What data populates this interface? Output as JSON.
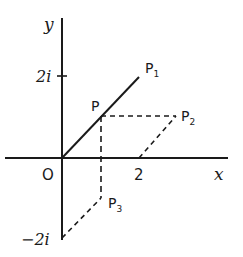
{
  "diagram": {
    "title": "",
    "axes": {
      "x_label": "x",
      "y_label": "y",
      "origin_label": "O",
      "x_tick_label": "2",
      "y_tick_pos_label": "2i",
      "y_tick_neg_label": "−2i"
    },
    "points": {
      "P": {
        "label": "P",
        "value": "1+i"
      },
      "P1": {
        "label": "P",
        "sub": "1",
        "value": "2+2i"
      },
      "P2": {
        "label": "P",
        "sub": "2",
        "value": "3+i"
      },
      "P3": {
        "label": "P",
        "sub": "3",
        "value": "1−2i"
      }
    },
    "colors": {
      "line": "#1a1a1a",
      "background": "#ffffff"
    }
  }
}
